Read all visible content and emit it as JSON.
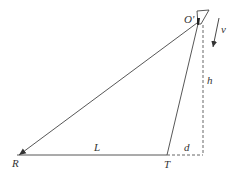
{
  "diagram": {
    "type": "geometry-physics",
    "colors": {
      "line": "#444444",
      "dashed": "#555555",
      "label": "#333333",
      "background": "#ffffff"
    },
    "points": {
      "O_prime": {
        "label": "O'"
      },
      "R": {
        "label": "R"
      },
      "T": {
        "label": "T"
      }
    },
    "labels": {
      "velocity": "v",
      "height": "h",
      "length": "L",
      "distance": "d"
    }
  }
}
